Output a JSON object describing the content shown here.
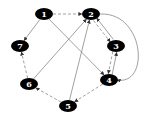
{
  "diagram": {
    "type": "directed-graph",
    "nodes": [
      {
        "id": "1",
        "label": "1",
        "x": 44,
        "y": 14
      },
      {
        "id": "2",
        "label": "2",
        "x": 91,
        "y": 14
      },
      {
        "id": "3",
        "label": "3",
        "x": 116,
        "y": 46
      },
      {
        "id": "4",
        "label": "4",
        "x": 109,
        "y": 80
      },
      {
        "id": "5",
        "label": "5",
        "x": 68,
        "y": 106
      },
      {
        "id": "6",
        "label": "6",
        "x": 29,
        "y": 84
      },
      {
        "id": "7",
        "label": "7",
        "x": 20,
        "y": 46
      }
    ],
    "edges": [
      {
        "from": "1",
        "to": "2",
        "style": "dashed"
      },
      {
        "from": "1",
        "to": "7",
        "style": "solid"
      },
      {
        "from": "1",
        "to": "4",
        "style": "solid"
      },
      {
        "from": "2",
        "to": "3",
        "style": "dashed"
      },
      {
        "from": "3",
        "to": "2",
        "style": "solid"
      },
      {
        "from": "2",
        "to": "4",
        "style": "solid",
        "curved": true
      },
      {
        "from": "3",
        "to": "4",
        "style": "dashed"
      },
      {
        "from": "4",
        "to": "3",
        "style": "solid"
      },
      {
        "from": "4",
        "to": "5",
        "style": "dashed"
      },
      {
        "from": "5",
        "to": "6",
        "style": "dashed"
      },
      {
        "from": "6",
        "to": "7",
        "style": "dashed"
      },
      {
        "from": "6",
        "to": "2",
        "style": "solid"
      },
      {
        "from": "5",
        "to": "2",
        "style": "solid"
      }
    ],
    "colors": {
      "node_fill": "#000000",
      "label": "#ffffff",
      "edge": "#888888"
    }
  }
}
